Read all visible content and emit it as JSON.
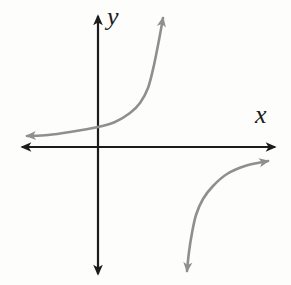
{
  "figure": {
    "width": 291,
    "height": 285,
    "background": "#fdfdfc"
  },
  "chart_data": {
    "type": "line",
    "title": "",
    "xlabel": "x",
    "ylabel": "y",
    "grid": false,
    "legend": null,
    "tick_labels": "none (qualitative sketch, no scale shown)",
    "units": "screen pixels, origin of axes at (98,147), y increases downward",
    "axes": {
      "style": "centered axes with solid arrowheads on both ends",
      "color": "#1c1c1c",
      "stroke_width": 2.2,
      "origin_px": [
        98,
        147
      ],
      "x_axis_px": {
        "from": [
          22,
          147
        ],
        "to": [
          275,
          147
        ]
      },
      "y_axis_px": {
        "from": [
          98,
          274
        ],
        "to": [
          98,
          16
        ]
      }
    },
    "series": [
      {
        "name": "upper-left-branch",
        "color": "#8f8f8f",
        "stroke_width": 2.6,
        "arrows": [
          "start",
          "end"
        ],
        "points_px": [
          [
            27,
            136
          ],
          [
            48,
            135
          ],
          [
            70,
            132
          ],
          [
            98,
            127
          ],
          [
            115,
            122
          ],
          [
            130,
            113
          ],
          [
            140,
            103
          ],
          [
            148,
            88
          ],
          [
            154,
            65
          ],
          [
            159,
            40
          ],
          [
            163,
            18
          ]
        ]
      },
      {
        "name": "lower-right-branch",
        "color": "#8f8f8f",
        "stroke_width": 2.6,
        "arrows": [
          "start",
          "end"
        ],
        "points_px": [
          [
            187,
            271
          ],
          [
            189,
            252
          ],
          [
            192,
            233
          ],
          [
            196,
            215
          ],
          [
            203,
            199
          ],
          [
            213,
            186
          ],
          [
            227,
            174
          ],
          [
            245,
            166
          ],
          [
            268,
            161
          ]
        ]
      }
    ]
  }
}
